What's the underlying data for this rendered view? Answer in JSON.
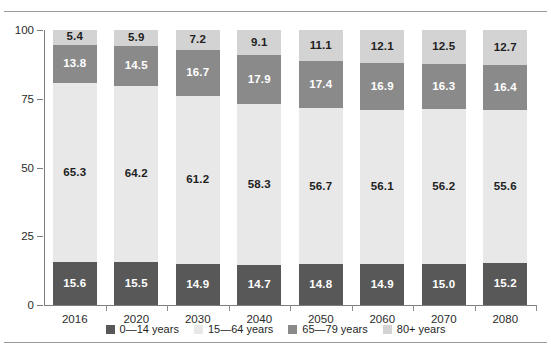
{
  "chart_data": {
    "type": "bar",
    "stacked": true,
    "title": "",
    "xlabel": "",
    "ylabel": "",
    "ylim": [
      0,
      100
    ],
    "yticks": [
      0,
      25,
      50,
      75,
      100
    ],
    "grid": false,
    "legend_position": "bottom",
    "categories": [
      "2016",
      "2020",
      "2030",
      "2040",
      "2050",
      "2060",
      "2070",
      "2080"
    ],
    "series": [
      {
        "name": "0—14 years",
        "color": "#585858",
        "values": [
          15.6,
          15.5,
          14.9,
          14.7,
          14.8,
          14.9,
          15.0,
          15.2
        ]
      },
      {
        "name": "15—64 years",
        "color": "#e8e8e8",
        "values": [
          65.3,
          64.2,
          61.2,
          58.3,
          56.7,
          56.1,
          56.2,
          55.6
        ]
      },
      {
        "name": "65—79 years",
        "color": "#8a8a8a",
        "values": [
          13.8,
          14.5,
          16.7,
          17.9,
          17.4,
          16.9,
          16.3,
          16.4
        ]
      },
      {
        "name": "80+ years",
        "color": "#d3d3d3",
        "values": [
          5.4,
          5.9,
          7.2,
          9.1,
          11.1,
          12.1,
          12.5,
          12.7
        ]
      }
    ]
  },
  "axis": {
    "y_tick_labels": [
      "0",
      "25",
      "50",
      "75",
      "100"
    ]
  }
}
